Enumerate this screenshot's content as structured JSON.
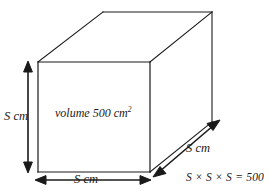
{
  "diagram": {
    "type": "cuboid-oblique-projection",
    "background_color": "#ffffff",
    "stroke_color": "#1a1a1a",
    "labels": {
      "height": "S cm",
      "width": "S cm",
      "depth": "S cm",
      "volume": "volume 500 cm",
      "volume_exponent": "2",
      "equation": "S × S × S = 500"
    },
    "geometry": {
      "front_face": {
        "left": 38,
        "top": 62,
        "right": 150,
        "bottom": 172
      },
      "back_offset": {
        "x": 62,
        "y": -50
      }
    },
    "dimension_arrows": {
      "height_arrow": {
        "x": 28,
        "y1": 62,
        "y2": 172
      },
      "width_arrow": {
        "y": 180,
        "x1": 36,
        "x2": 150
      },
      "depth_arrow": {
        "x1": 155,
        "y1": 176,
        "x2": 218,
        "y2": 121
      }
    }
  }
}
